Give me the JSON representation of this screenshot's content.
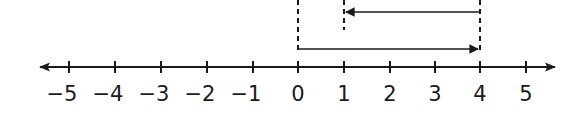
{
  "diagram": {
    "type": "number_line",
    "range": [
      -5,
      5
    ],
    "ticks": [
      "−5",
      "−4",
      "−3",
      "−2",
      "−1",
      "0",
      "1",
      "2",
      "3",
      "4",
      "5"
    ],
    "jumps": [
      {
        "name": "first-jump",
        "from": 0,
        "to": 4,
        "direction": "right"
      },
      {
        "name": "second-jump",
        "from": 4,
        "to": 1,
        "direction": "left"
      }
    ],
    "guide_lines_at": [
      0,
      1,
      4
    ],
    "colors": {
      "ink": "#1a1a1a",
      "background": "#ffffff"
    }
  }
}
